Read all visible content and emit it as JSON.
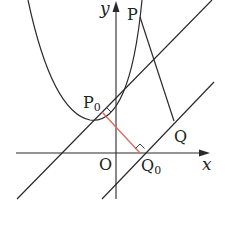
{
  "diagram": {
    "type": "coordinate-geometry",
    "labels": {
      "y_axis": "y",
      "x_axis": "x",
      "origin": "O",
      "P": "P",
      "P0": "P",
      "P0_sub": "0",
      "Q": "Q",
      "Q0": "Q",
      "Q0_sub": "0"
    },
    "colors": {
      "stroke": "#2a2a2a",
      "segment_P0Q0": "#e06a5a",
      "background": "#ffffff"
    }
  }
}
